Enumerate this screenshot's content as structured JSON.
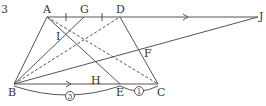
{
  "figure": {
    "label": "3",
    "colors": {
      "stroke": "#555555",
      "text": "#333333"
    }
  },
  "points": {
    "A": {
      "label": "A",
      "x": 47,
      "y": 17
    },
    "G": {
      "label": "G",
      "x": 84,
      "y": 17
    },
    "D": {
      "label": "D",
      "x": 120,
      "y": 17
    },
    "J": {
      "label": "J",
      "x": 258,
      "y": 17
    },
    "B": {
      "label": "B",
      "x": 14,
      "y": 84
    },
    "E": {
      "label": "E",
      "x": 120,
      "y": 84
    },
    "C": {
      "label": "C",
      "x": 158,
      "y": 84
    },
    "I": {
      "label": "I",
      "x": 65,
      "y": 35
    },
    "H": {
      "label": "H",
      "x": 95,
      "y": 71
    },
    "F": {
      "label": "F",
      "x": 140,
      "y": 49
    }
  },
  "ratios": {
    "BE": "3",
    "EC": "1"
  }
}
